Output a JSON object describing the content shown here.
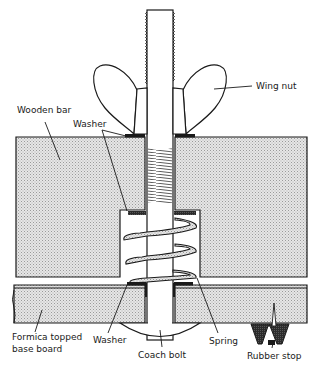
{
  "diagram": {
    "type": "cross-section",
    "labels": {
      "wing_nut": "Wing nut",
      "wooden_bar": "Wooden bar",
      "washer_top": "Washer",
      "formica_line1": "Formica topped",
      "formica_line2": "base board",
      "washer_bottom": "Washer",
      "coach_bolt": "Coach bolt",
      "spring": "Spring",
      "rubber_stop": "Rubber stop"
    },
    "colors": {
      "ink": "#1a1a1a",
      "wood_fill": "#d9d9d9",
      "dark_fill": "#2b2b2b",
      "background": "#ffffff"
    }
  }
}
